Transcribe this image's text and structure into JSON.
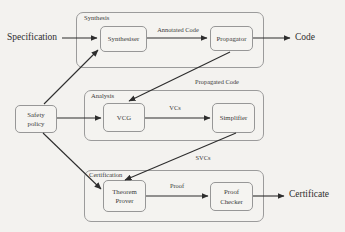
{
  "colors": {
    "background": "#f3f2ef",
    "box_border": "#9b9b9b",
    "arrow": "#2d2d2d",
    "text": "#3b3b3b"
  },
  "external_labels": {
    "specification": "Specification",
    "code": "Code",
    "certificate": "Certificate"
  },
  "groups": {
    "synthesis": "Synthesis",
    "analysis": "Analysis",
    "certification": "Certification"
  },
  "nodes": {
    "synthesiser": "Synthesiser",
    "propagator": "Propagator",
    "vcg": "VCG",
    "simplifier": "Simplifier",
    "theorem_prover": "Theorem Prover",
    "proof_checker": "Proof Checker",
    "safety_policy": "Safety policy"
  },
  "edge_labels": {
    "annotated_code": "Annotated Code",
    "propagated_code": "Propagated Code",
    "vcs": "VCs",
    "svcs": "SVCs",
    "proof": "Proof"
  }
}
